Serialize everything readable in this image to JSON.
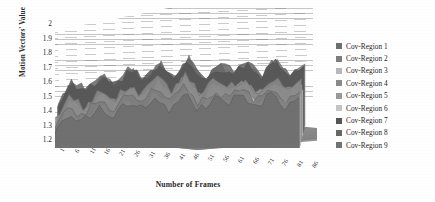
{
  "chart_data": {
    "type": "area",
    "title": "",
    "xlabel": "Number of Frames",
    "ylabel": "Motion Vectors' Value",
    "ylim": [
      1.2,
      2
    ],
    "ytick_labels": [
      "2",
      "1.9",
      "1.8",
      "1.7",
      "1.6",
      "1.5",
      "1.4",
      "1.3",
      "1.2"
    ],
    "ytick_values": [
      2,
      1.9,
      1.8,
      1.7,
      1.6,
      1.5,
      1.4,
      1.3,
      1.2
    ],
    "grid": true,
    "projection": "3d",
    "legend_position": "right",
    "xtick_labels": [
      "1",
      "6",
      "11",
      "16",
      "21",
      "26",
      "31",
      "36",
      "41",
      "46",
      "51",
      "56",
      "61",
      "66",
      "71",
      "76",
      "81",
      "86"
    ],
    "x": [
      1,
      6,
      11,
      16,
      21,
      26,
      31,
      36,
      41,
      46,
      51,
      56,
      61,
      66,
      71,
      76,
      81,
      86
    ],
    "series": [
      {
        "name": "Cov-Region 1",
        "color": "#6f6f6f",
        "values": [
          1.3,
          1.47,
          1.39,
          1.52,
          1.44,
          1.58,
          1.49,
          1.62,
          1.51,
          1.66,
          1.48,
          1.6,
          1.55,
          1.63,
          1.5,
          1.64,
          1.53,
          1.59
        ]
      },
      {
        "name": "Cov-Region 2",
        "color": "#7d7d7d",
        "values": [
          1.33,
          1.5,
          1.42,
          1.56,
          1.47,
          1.61,
          1.52,
          1.65,
          1.55,
          1.69,
          1.51,
          1.63,
          1.58,
          1.66,
          1.54,
          1.67,
          1.56,
          1.62
        ]
      },
      {
        "name": "Cov-Region 3",
        "color": "#b9b9b9",
        "values": [
          1.28,
          1.44,
          1.37,
          1.5,
          1.41,
          1.55,
          1.46,
          1.59,
          1.49,
          1.63,
          1.45,
          1.57,
          1.52,
          1.6,
          1.47,
          1.61,
          1.5,
          1.56
        ]
      },
      {
        "name": "Cov-Region 4",
        "color": "#8a8a8a",
        "values": [
          1.35,
          1.53,
          1.45,
          1.59,
          1.5,
          1.64,
          1.55,
          1.68,
          1.57,
          1.72,
          1.54,
          1.66,
          1.61,
          1.69,
          1.57,
          1.7,
          1.59,
          1.65
        ]
      },
      {
        "name": "Cov-Region 5",
        "color": "#9a9a9a",
        "values": [
          1.31,
          1.48,
          1.4,
          1.54,
          1.45,
          1.59,
          1.5,
          1.63,
          1.53,
          1.67,
          1.49,
          1.61,
          1.56,
          1.64,
          1.51,
          1.65,
          1.54,
          1.6
        ]
      },
      {
        "name": "Cov-Region 6",
        "color": "#c4c4c4",
        "values": [
          1.26,
          1.42,
          1.35,
          1.48,
          1.39,
          1.53,
          1.44,
          1.57,
          1.47,
          1.61,
          1.43,
          1.55,
          1.5,
          1.58,
          1.45,
          1.59,
          1.48,
          1.54
        ]
      },
      {
        "name": "Cov-Region 7",
        "color": "#555555",
        "values": [
          1.38,
          1.57,
          1.48,
          1.63,
          1.54,
          1.68,
          1.59,
          1.72,
          1.61,
          1.76,
          1.58,
          1.7,
          1.65,
          1.73,
          1.61,
          1.74,
          1.63,
          1.69
        ]
      },
      {
        "name": "Cov-Region 8",
        "color": "#676767",
        "values": [
          1.36,
          1.55,
          1.46,
          1.61,
          1.52,
          1.66,
          1.57,
          1.7,
          1.59,
          1.74,
          1.56,
          1.68,
          1.63,
          1.71,
          1.59,
          1.72,
          1.61,
          1.67
        ]
      },
      {
        "name": "Cov-Region 9",
        "color": "#737373",
        "values": [
          1.34,
          1.51,
          1.43,
          1.57,
          1.48,
          1.62,
          1.53,
          1.66,
          1.56,
          1.7,
          1.52,
          1.64,
          1.59,
          1.67,
          1.55,
          1.68,
          1.57,
          1.63
        ]
      }
    ]
  },
  "axes": {
    "ylabel": "Motion Vectors' Value",
    "xlabel": "Number of Frames"
  },
  "legend": {
    "items": [
      {
        "label": "Cov-Region 1",
        "color": "#6f6f6f"
      },
      {
        "label": "Cov-Region 2",
        "color": "#7d7d7d"
      },
      {
        "label": "Cov-Region 3",
        "color": "#b9b9b9"
      },
      {
        "label": "Cov-Region 4",
        "color": "#8a8a8a"
      },
      {
        "label": "Cov-Region 5",
        "color": "#9a9a9a"
      },
      {
        "label": "Cov-Region 6",
        "color": "#c4c4c4"
      },
      {
        "label": "Cov-Region 7",
        "color": "#555555"
      },
      {
        "label": "Cov-Region 8",
        "color": "#676767"
      },
      {
        "label": "Cov-Region 9",
        "color": "#737373"
      }
    ]
  }
}
